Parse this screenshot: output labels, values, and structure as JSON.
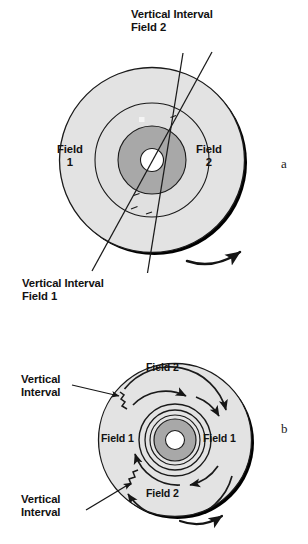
{
  "figure": {
    "background": "#ffffff",
    "panels": [
      {
        "id": "a",
        "letter": "a",
        "kind": "clv-disc-with-radial-vertical-intervals",
        "disc": {
          "cx": 152,
          "cy": 160,
          "outer_radius": 93,
          "mid_ring_radius": 57,
          "inner_ring_radius": 34,
          "hub_radius": 11
        },
        "callouts": [
          {
            "name": "vertical-interval-field-2",
            "line1": "Vertical Interval",
            "line2": "Field 2"
          },
          {
            "name": "vertical-interval-field-1",
            "line1": "Vertical Interval",
            "line2": "Field 1"
          }
        ],
        "field_labels": [
          {
            "name": "field-1",
            "line1": "Field",
            "line2": "1"
          },
          {
            "name": "field-2",
            "line1": "Field",
            "line2": "2"
          }
        ],
        "rotation": "clockwise"
      },
      {
        "id": "b",
        "letter": "b",
        "kind": "cav-disc-with-concentric-field-tracks",
        "disc": {
          "cx": 175,
          "cy": 440,
          "outer_radius": 77,
          "hub_radius": 9,
          "dark_ring_radius": 21
        },
        "callouts": [
          {
            "name": "vertical-interval-upper",
            "line1": "Vertical",
            "line2": "Interval"
          },
          {
            "name": "vertical-interval-lower",
            "line1": "Vertical",
            "line2": "Interval"
          }
        ],
        "field_labels": [
          {
            "name": "field-2-top",
            "text": "Field 2"
          },
          {
            "name": "field-2-bottom",
            "text": "Field 2"
          },
          {
            "name": "field-1-left",
            "text": "Field 1"
          },
          {
            "name": "field-1-right",
            "text": "Field 1"
          }
        ],
        "rotation": "clockwise"
      }
    ],
    "colors": {
      "disc_body": "#e3e3e3",
      "disc_mid_ring": "#e0e0e0",
      "disc_inner_dark": "#a8a8a8",
      "hub_white": "#ffffff",
      "outline": "#1a1a1a",
      "shadow_edge": "#000000",
      "text": "#121212"
    }
  }
}
